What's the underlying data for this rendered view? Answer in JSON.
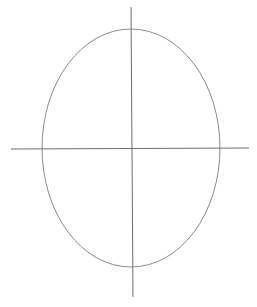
{
  "diagram": {
    "type": "ellipse-with-axes",
    "canvas": {
      "width": 257,
      "height": 307,
      "background": "#ffffff"
    },
    "ellipse": {
      "cx": 131,
      "cy": 148,
      "rx": 89,
      "ry": 119,
      "stroke": "#8a8a8a",
      "stroke_width": 1
    },
    "horizontal_axis": {
      "x1": 11,
      "y1": 149,
      "x2": 249,
      "y2": 148,
      "stroke": "#6e6e6e",
      "stroke_width": 1
    },
    "vertical_axis": {
      "x1": 131,
      "y1": 7,
      "x2": 133,
      "y2": 297,
      "stroke": "#6e6e6e",
      "stroke_width": 1
    }
  }
}
